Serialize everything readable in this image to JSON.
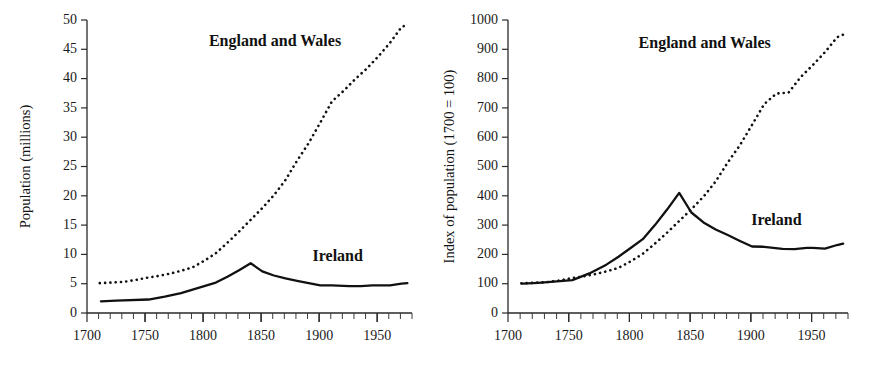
{
  "figure": {
    "background": "#ffffff",
    "ink_color": "#111111"
  },
  "chart_data": [
    {
      "id": "left",
      "type": "line",
      "title": "",
      "xlabel": "",
      "ylabel": "Population (millions)",
      "xlim": [
        1700,
        1980
      ],
      "ylim": [
        0,
        50
      ],
      "grid": false,
      "legend": "inline-annotations",
      "x_ticks_major": [
        1700,
        1750,
        1800,
        1850,
        1900,
        1950
      ],
      "x_ticks_major_labels": [
        "1700",
        "1750",
        "1800",
        "1850",
        "1900",
        "1950"
      ],
      "x_tick_minor_step": 10,
      "y_ticks": [
        0,
        5,
        10,
        15,
        20,
        25,
        30,
        35,
        40,
        45,
        50
      ],
      "y_tick_labels": [
        "0",
        "5",
        "10",
        "15",
        "20",
        "25",
        "30",
        "35",
        "40",
        "45",
        "50"
      ],
      "series": [
        {
          "name": "England and Wales",
          "style": "dotted",
          "label_x": 1862,
          "label_y": 45.5,
          "x": [
            1711,
            1721,
            1731,
            1741,
            1751,
            1761,
            1771,
            1781,
            1791,
            1801,
            1811,
            1821,
            1831,
            1841,
            1851,
            1861,
            1871,
            1881,
            1891,
            1901,
            1911,
            1921,
            1931,
            1941,
            1951,
            1961,
            1971,
            1976
          ],
          "y": [
            5.1,
            5.2,
            5.3,
            5.6,
            6.0,
            6.3,
            6.7,
            7.2,
            7.8,
            8.9,
            10.2,
            12.0,
            13.9,
            15.9,
            17.9,
            20.1,
            22.7,
            26.0,
            29.0,
            32.5,
            36.1,
            37.9,
            39.9,
            41.7,
            43.8,
            46.1,
            48.8,
            49.2
          ]
        },
        {
          "name": "Ireland",
          "style": "solid",
          "label_x": 1916,
          "label_y": 8.8,
          "x": [
            1712,
            1725,
            1753,
            1767,
            1781,
            1791,
            1801,
            1811,
            1821,
            1831,
            1841,
            1851,
            1861,
            1871,
            1881,
            1891,
            1901,
            1911,
            1926,
            1936,
            1946,
            1951,
            1961,
            1971,
            1976
          ],
          "y": [
            2.0,
            2.1,
            2.3,
            2.8,
            3.4,
            4.0,
            4.6,
            5.2,
            6.2,
            7.3,
            8.5,
            7.1,
            6.4,
            5.9,
            5.5,
            5.1,
            4.7,
            4.7,
            4.6,
            4.6,
            4.7,
            4.7,
            4.7,
            5.0,
            5.1
          ]
        }
      ]
    },
    {
      "id": "right",
      "type": "line",
      "title": "",
      "xlabel": "",
      "ylabel": "Index of population (1700 = 100)",
      "xlim": [
        1700,
        1980
      ],
      "ylim": [
        0,
        1000
      ],
      "grid": false,
      "legend": "inline-annotations",
      "x_ticks_major": [
        1700,
        1750,
        1800,
        1850,
        1900,
        1950
      ],
      "x_ticks_major_labels": [
        "1700",
        "1750",
        "1800",
        "1850",
        "1900",
        "1950"
      ],
      "x_tick_minor_step": 10,
      "y_ticks": [
        0,
        100,
        200,
        300,
        400,
        500,
        600,
        700,
        800,
        900,
        1000
      ],
      "y_tick_labels": [
        "0",
        "100",
        "200",
        "300",
        "400",
        "500",
        "600",
        "700",
        "800",
        "900",
        "1000"
      ],
      "series": [
        {
          "name": "England and Wales",
          "style": "dotted",
          "label_x": 1862,
          "label_y": 905,
          "x": [
            1711,
            1721,
            1731,
            1741,
            1751,
            1761,
            1771,
            1781,
            1791,
            1801,
            1811,
            1821,
            1831,
            1841,
            1851,
            1861,
            1871,
            1881,
            1891,
            1901,
            1911,
            1921,
            1931,
            1941,
            1951,
            1961,
            1971,
            1976
          ],
          "y": [
            101,
            103,
            105,
            110,
            118,
            124,
            132,
            142,
            154,
            176,
            202,
            237,
            274,
            314,
            354,
            397,
            449,
            514,
            573,
            642,
            713,
            749,
            752,
            805,
            846,
            890,
            941,
            950
          ]
        },
        {
          "name": "Ireland",
          "style": "solid",
          "label_x": 1921,
          "label_y": 300,
          "x": [
            1712,
            1725,
            1753,
            1767,
            1781,
            1791,
            1801,
            1811,
            1821,
            1831,
            1841,
            1851,
            1861,
            1871,
            1881,
            1891,
            1901,
            1911,
            1926,
            1936,
            1946,
            1951,
            1961,
            1971,
            1976
          ],
          "y": [
            100,
            103,
            112,
            135,
            165,
            192,
            222,
            252,
            300,
            353,
            410,
            343,
            309,
            285,
            266,
            246,
            227,
            226,
            219,
            218,
            222,
            222,
            220,
            232,
            237
          ]
        }
      ]
    }
  ]
}
